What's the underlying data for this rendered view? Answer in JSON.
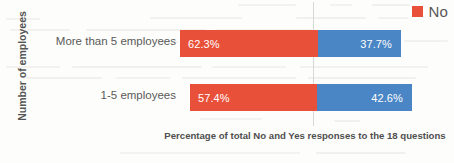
{
  "chart_data": {
    "type": "bar",
    "orientation": "horizontal",
    "stacked": true,
    "normalized_percent": true,
    "title": "",
    "xlabel": "Percentage of total No and Yes responses to the 18 questions",
    "ylabel": "Number of employees",
    "categories": [
      "More than 5 employees",
      "1-5 employees"
    ],
    "series": [
      {
        "name": "No",
        "color": "#e8503a",
        "values": [
          62.3,
          57.4
        ],
        "labels": [
          "62.3%",
          "37.7%"
        ]
      },
      {
        "name": "Yes",
        "color": "#4a86c5",
        "values": [
          37.7,
          42.6
        ],
        "labels": [
          "42.6%",
          "42.6%"
        ]
      }
    ],
    "rows": [
      {
        "category": "More than 5 employees",
        "no_value": 62.3,
        "no_label": "62.3%",
        "yes_value": 37.7,
        "yes_label": "37.7%"
      },
      {
        "category": "1-5 employees",
        "no_value": 57.4,
        "no_label": "57.4%",
        "yes_value": 42.6,
        "yes_label": "42.6%"
      }
    ],
    "xlim": [
      0,
      100
    ],
    "grid": true,
    "legend_position": "top-right",
    "legend": [
      {
        "label": "No",
        "color": "#e8503a"
      }
    ]
  },
  "legend": {
    "no_label": "No"
  },
  "axes": {
    "y_title": "Number of employees",
    "x_caption": "Percentage of total No and Yes responses to the 18 questions"
  },
  "colors": {
    "no": "#e8503a",
    "yes": "#4a86c5",
    "gridline": "#d7d7d7",
    "text": "#5a5a5a",
    "background": "#fdfdfb"
  }
}
